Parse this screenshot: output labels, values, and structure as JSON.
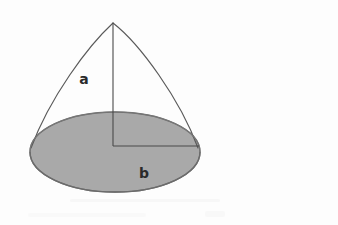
{
  "figure": {
    "background_color": "#fdfdfd",
    "outline_color": "#4a4a4a",
    "shade_color": "#a9a9a9",
    "shade_edge_color": "#6e6e6e",
    "label_color": "#2a2a2a",
    "labels": {
      "side": "a",
      "base": "b"
    },
    "geometry": {
      "apex": {
        "x": 113,
        "y": 23
      },
      "base_ellipse": {
        "center_x": 115,
        "center_y": 152,
        "radius_x": 85,
        "radius_y": 40
      },
      "axis_line": {
        "x1": 113,
        "y1": 23,
        "x2": 113,
        "y2": 146
      },
      "radius_line": {
        "x1": 113,
        "y1": 146,
        "x2": 199,
        "y2": 146
      },
      "left_curve_end": {
        "x": 31,
        "y": 148
      },
      "right_curve_end": {
        "x": 198,
        "y": 148
      }
    },
    "label_positions": {
      "side": {
        "x": 84,
        "y": 84
      },
      "base": {
        "x": 144,
        "y": 178
      }
    }
  }
}
